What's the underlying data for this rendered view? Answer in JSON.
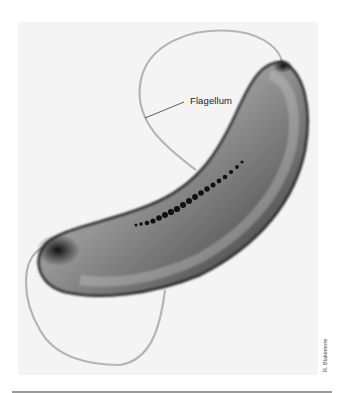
{
  "figure": {
    "labels": [
      {
        "text": "Flagellum"
      }
    ],
    "credit": "R. Blakemore",
    "colors": {
      "background": "#ffffff",
      "photo_background": "#f4f4f4",
      "cell_dark": "#1a1a1a",
      "cell_mid": "#8a8a8a",
      "flagellum": "#b5b5b5",
      "magnetosome": "#111111",
      "rule": "#9a9a9a"
    }
  }
}
